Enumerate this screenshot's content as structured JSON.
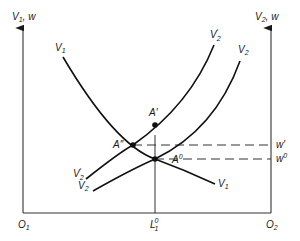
{
  "diagram": {
    "type": "two-region labor market equilibrium",
    "axes": {
      "left_y_label": {
        "main": "V",
        "sub": "1",
        "suffix": ", w"
      },
      "right_y_label": {
        "main": "V",
        "sub": "2",
        "suffix": ", w"
      },
      "origin_left": {
        "main": "O",
        "sub": "1"
      },
      "origin_right": {
        "main": "O",
        "sub": "2"
      },
      "x_tick": {
        "main": "L",
        "sub": "1",
        "sup": "0"
      }
    },
    "curves": [
      {
        "id": "V1",
        "label_main": "V",
        "label_sub": "1",
        "direction": "downward-sloping from left"
      },
      {
        "id": "V2prime",
        "label_main": "V",
        "label_sub": "2",
        "label_prime": "′",
        "direction": "upward-sloping"
      },
      {
        "id": "V2",
        "label_main": "V",
        "label_sub": "2",
        "direction": "upward-sloping"
      }
    ],
    "points": [
      {
        "id": "A-prime",
        "label": "A′"
      },
      {
        "id": "A-double-prime",
        "label": "A″"
      },
      {
        "id": "A-zero",
        "label_main": "A",
        "label_sup": "0"
      }
    ],
    "wage_levels": [
      {
        "id": "w-prime",
        "label": "w′"
      },
      {
        "id": "w-zero",
        "label_main": "w",
        "label_sup": "0"
      }
    ]
  }
}
